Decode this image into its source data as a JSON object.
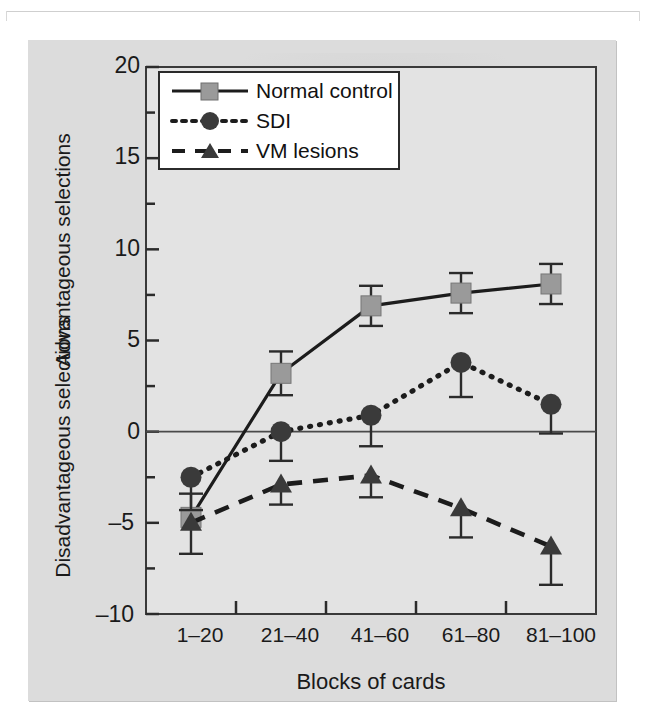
{
  "figure": {
    "background_color": "#dcdcdc",
    "plot_background_color": "#e3e3e3",
    "frame_color": "#3a3a3a"
  },
  "chart_data": {
    "type": "line",
    "title": "",
    "xlabel": "Blocks of cards",
    "ylabel_top": "Advantageous selections",
    "ylabel_bottom": "Disadvantageous selections",
    "categories": [
      "1–20",
      "21–40",
      "41–60",
      "61–80",
      "81–100"
    ],
    "yticks": [
      -10,
      -5,
      0,
      5,
      10,
      15,
      20
    ],
    "ytick_labels": [
      "–10",
      "–5",
      "0",
      "5",
      "10",
      "15",
      "20"
    ],
    "ylim": [
      -10,
      20
    ],
    "minor_ytick_step": 2.5,
    "grid": false,
    "zero_line": true,
    "legend_position": "top-left",
    "series": [
      {
        "name": "Normal control",
        "marker": "square",
        "marker_color": "#9a9a9a",
        "line_style": "solid",
        "line_color": "#1c1c1c",
        "values": [
          -4.7,
          3.2,
          6.9,
          7.6,
          8.1
        ],
        "err_upper": [
          -3.4,
          4.4,
          8.0,
          8.7,
          9.2
        ],
        "err_lower": [
          -6.7,
          2.0,
          5.8,
          6.5,
          7.0
        ]
      },
      {
        "name": "SDI",
        "marker": "circle",
        "marker_color": "#3a3a3a",
        "line_style": "dotted",
        "line_color": "#1c1c1c",
        "values": [
          -2.5,
          0.0,
          0.9,
          3.8,
          1.5
        ],
        "err_upper": [
          -2.5,
          0.0,
          0.9,
          3.8,
          1.5
        ],
        "err_lower": [
          -4.3,
          -1.6,
          -0.8,
          1.9,
          -0.1
        ]
      },
      {
        "name": "VM lesions",
        "marker": "triangle",
        "marker_color": "#3a3a3a",
        "line_style": "dashed",
        "line_color": "#1c1c1c",
        "values": [
          -5.0,
          -2.9,
          -2.4,
          -4.2,
          -6.3
        ],
        "err_upper": [
          -5.0,
          -2.9,
          -2.4,
          -4.2,
          -6.3
        ],
        "err_lower": [
          -5.0,
          -4.0,
          -3.6,
          -5.8,
          -8.4
        ]
      }
    ]
  },
  "legend": {
    "items": [
      {
        "label": "Normal control",
        "key": "solid-square-key"
      },
      {
        "label": "SDI",
        "key": "dotted-circle-key"
      },
      {
        "label": "VM lesions",
        "key": "dashed-triangle-key"
      }
    ]
  }
}
